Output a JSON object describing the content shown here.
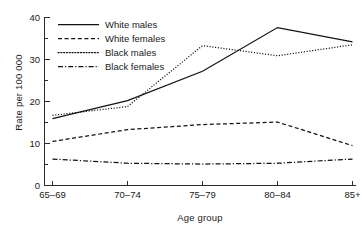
{
  "chart_data": {
    "type": "line",
    "title": "",
    "xlabel": "Age group",
    "ylabel": "Rate per 100 000",
    "categories": [
      "65–69",
      "70–74",
      "75–79",
      "80–84",
      "85+"
    ],
    "ylim": [
      0,
      40
    ],
    "yticks": [
      0,
      10,
      20,
      30,
      40
    ],
    "ytick_labels": [
      "0",
      "10",
      "20",
      "30",
      "40"
    ],
    "yticks_minor": [
      5,
      15,
      25,
      35
    ],
    "grid": false,
    "legend_position": "upper-left-inside",
    "series": [
      {
        "name": "White males",
        "style": "solid",
        "values": [
          15.9,
          20.2,
          27.2,
          37.6,
          34.2
        ]
      },
      {
        "name": "White females",
        "style": "dashed",
        "values": [
          10.5,
          13.3,
          14.5,
          15.1,
          9.5
        ]
      },
      {
        "name": "Black males",
        "style": "dotted",
        "values": [
          16.7,
          18.8,
          33.3,
          30.9,
          33.5
        ]
      },
      {
        "name": "Black females",
        "style": "dash-dot",
        "values": [
          6.3,
          5.3,
          5.1,
          5.3,
          6.3
        ]
      }
    ]
  },
  "legend": {
    "items": [
      {
        "label": "White males"
      },
      {
        "label": "White females"
      },
      {
        "label": "Black males"
      },
      {
        "label": "Black females"
      }
    ]
  },
  "axes": {
    "y_title": "Rate per 100 000",
    "x_title": "Age group",
    "y_tick_0": "0",
    "y_tick_1": "10",
    "y_tick_2": "20",
    "y_tick_3": "30",
    "y_tick_4": "40",
    "x_tick_0": "65–69",
    "x_tick_1": "70–74",
    "x_tick_2": "75–79",
    "x_tick_3": "80–84",
    "x_tick_4": "85+"
  },
  "colors": {
    "line": "#111111",
    "axis": "#2b2b2b",
    "background": "#ffffff",
    "text": "#1a1a1a"
  }
}
